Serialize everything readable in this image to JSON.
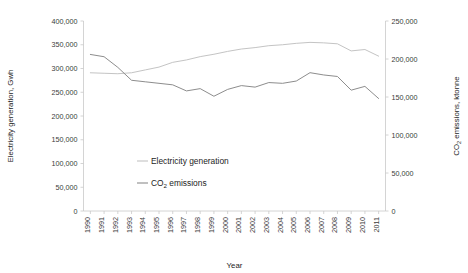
{
  "chart_data": {
    "type": "line",
    "title": "",
    "xlabel": "Year",
    "ylabel": "Electricity generation, Gwh",
    "y2label": "CO2 emissions, ktonne",
    "y2label_prefix": "CO",
    "y2label_sub": "2",
    "y2label_suffix": " emissions, ktonne",
    "grid": false,
    "legend_position": "inside-center-left",
    "categories": [
      "1990",
      "1991",
      "1992",
      "1993",
      "1994",
      "1995",
      "1996",
      "1997",
      "1998",
      "1999",
      "2000",
      "2001",
      "2002",
      "2003",
      "2004",
      "2005",
      "2006",
      "2007",
      "2008",
      "2009",
      "2010",
      "2011"
    ],
    "ylim": [
      0,
      400000
    ],
    "yticks": [
      0,
      50000,
      100000,
      150000,
      200000,
      250000,
      300000,
      350000,
      400000
    ],
    "ytick_labels": [
      "0",
      "50,000",
      "100,000",
      "150,000",
      "200,000",
      "250,000",
      "300,000",
      "350,000",
      "400,000"
    ],
    "y2lim": [
      0,
      250000
    ],
    "y2ticks": [
      0,
      50000,
      100000,
      150000,
      200000,
      250000
    ],
    "y2tick_labels": [
      "0",
      "50,000",
      "100,000",
      "150,000",
      "200,000",
      "250,000"
    ],
    "series": [
      {
        "name": "Electricity generation",
        "axis": "left",
        "color": "#c4c4c4",
        "units": "Gwh",
        "values": [
          291000,
          290000,
          289000,
          291000,
          297000,
          303000,
          313000,
          318000,
          325000,
          330000,
          336000,
          341000,
          344000,
          348000,
          350000,
          353000,
          355000,
          354000,
          352000,
          337000,
          340000,
          326000
        ]
      },
      {
        "name": "CO2 emissions",
        "axis": "right",
        "color": "#8d8d8d",
        "units": "ktonne",
        "label_prefix": "CO",
        "label_sub": "2",
        "label_suffix": " emissions",
        "values": [
          206000,
          203000,
          189000,
          172000,
          170000,
          168000,
          166000,
          158000,
          161000,
          151000,
          160000,
          165000,
          163000,
          169000,
          168000,
          171000,
          182000,
          179000,
          177000,
          159000,
          164000,
          148000
        ]
      }
    ],
    "legend": [
      {
        "label": "Electricity generation",
        "color": "#c4c4c4"
      },
      {
        "label": "CO2 emissions",
        "color": "#8d8d8d"
      }
    ]
  }
}
